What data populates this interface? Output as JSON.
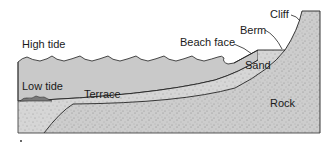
{
  "diagram": {
    "type": "beach-profile cross-section",
    "labels": {
      "high_tide": "High tide",
      "low_tide": "Low tide",
      "terrace": "Terrace",
      "beach_face": "Beach face",
      "berm": "Berm",
      "cliff": "Cliff",
      "sand": "Sand",
      "rock": "Rock"
    },
    "colors": {
      "water": "#c8c8c8",
      "sand": "#d9d9d9",
      "rock": "#cfcfcf",
      "outline": "#222222",
      "low_tide_water": "#7a7a7a"
    }
  }
}
